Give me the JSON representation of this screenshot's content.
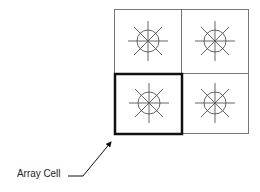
{
  "diagram": {
    "type": "2x2 array of antenna cells",
    "rows": 2,
    "cols": 2,
    "highlighted_cell": {
      "row": 1,
      "col": 0
    },
    "cell_icon": "radiating-element-icon",
    "callout_label": "Array Cell",
    "colors": {
      "grid": "#777777",
      "highlight": "#111111",
      "icon": "#555555"
    }
  }
}
